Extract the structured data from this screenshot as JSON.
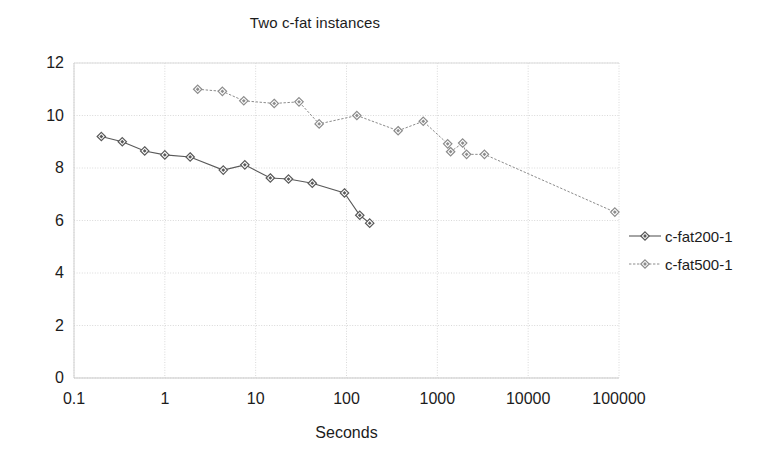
{
  "chart_data": {
    "type": "line",
    "title": "Two c-fat instances",
    "xlabel": "Seconds",
    "ylabel": "",
    "xscale": "log",
    "yscale": "linear",
    "xlim": [
      0.1,
      100000
    ],
    "ylim": [
      0,
      12
    ],
    "xticks": [
      "0.1",
      "1",
      "10",
      "100",
      "1000",
      "10000",
      "100000"
    ],
    "xtick_values": [
      0.1,
      1,
      10,
      100,
      1000,
      10000,
      100000
    ],
    "yticks": [
      "0",
      "2",
      "4",
      "6",
      "8",
      "10",
      "12"
    ],
    "ytick_values": [
      0,
      2,
      4,
      6,
      8,
      10,
      12
    ],
    "grid": true,
    "grid_color": "#d9d9d9",
    "legend_position": "right",
    "series": [
      {
        "name": "c-fat200-1",
        "color": "#595959",
        "marker": "diamond",
        "points": [
          [
            0.2,
            9.2
          ],
          [
            0.34,
            9.0
          ],
          [
            0.6,
            8.65
          ],
          [
            1.0,
            8.5
          ],
          [
            1.9,
            8.42
          ],
          [
            4.4,
            7.92
          ],
          [
            7.6,
            8.12
          ],
          [
            14.5,
            7.62
          ],
          [
            23.0,
            7.58
          ],
          [
            42.0,
            7.42
          ],
          [
            95.0,
            7.05
          ],
          [
            140.0,
            6.2
          ],
          [
            180.0,
            5.9
          ]
        ]
      },
      {
        "name": "c-fat500-1",
        "color": "#8c8c8c",
        "marker": "diamond",
        "points": [
          [
            2.3,
            11.0
          ],
          [
            4.3,
            10.92
          ],
          [
            7.4,
            10.56
          ],
          [
            16.0,
            10.46
          ],
          [
            30.0,
            10.52
          ],
          [
            50.0,
            9.68
          ],
          [
            130.0,
            10.0
          ],
          [
            370.0,
            9.42
          ],
          [
            700.0,
            9.78
          ],
          [
            1300.0,
            8.92
          ],
          [
            1400.0,
            8.62
          ],
          [
            1900.0,
            8.95
          ],
          [
            2100.0,
            8.52
          ],
          [
            3300.0,
            8.52
          ],
          [
            90000.0,
            6.32
          ]
        ]
      }
    ]
  },
  "legend": {
    "entries": [
      {
        "label": "c-fat200-1"
      },
      {
        "label": "c-fat500-1"
      }
    ]
  }
}
